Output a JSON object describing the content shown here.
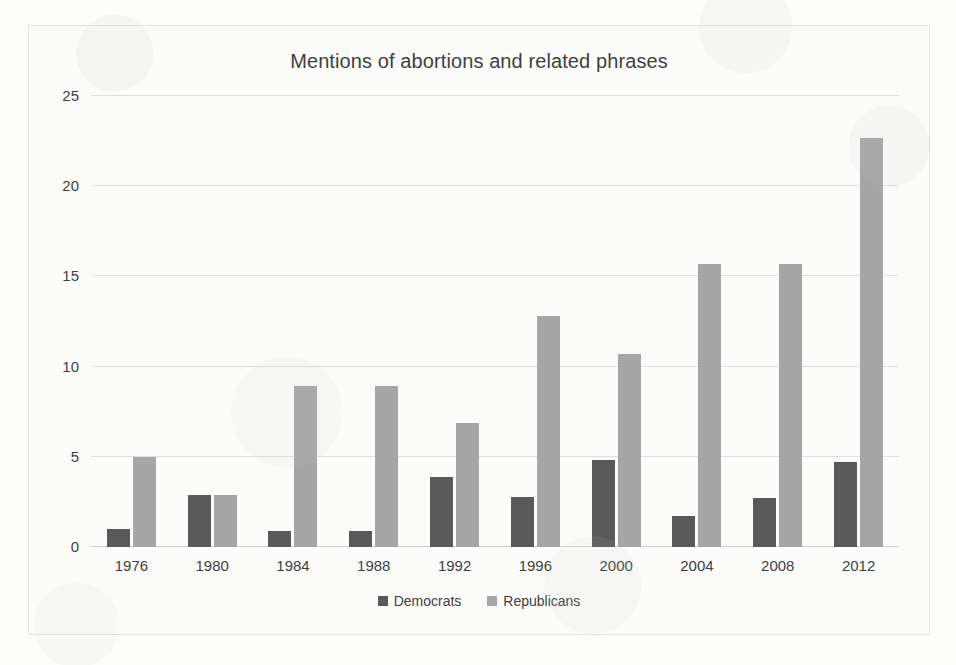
{
  "chart_data": {
    "type": "bar",
    "title": "Mentions of abortions and related phrases",
    "xlabel": "",
    "ylabel": "",
    "categories": [
      "1976",
      "1980",
      "1984",
      "1988",
      "1992",
      "1996",
      "2000",
      "2004",
      "2008",
      "2012"
    ],
    "series": [
      {
        "name": "Democrats",
        "color": "#595959",
        "values": [
          1.0,
          2.9,
          0.9,
          0.9,
          3.9,
          2.8,
          4.8,
          1.7,
          2.7,
          4.7
        ]
      },
      {
        "name": "Republicans",
        "color": "#a6a6a6",
        "values": [
          5.0,
          2.9,
          8.9,
          8.9,
          6.9,
          12.8,
          10.7,
          15.7,
          15.7,
          22.7
        ]
      }
    ],
    "ylim": [
      0,
      25
    ],
    "yticks": [
      0,
      5,
      10,
      15,
      20,
      25
    ],
    "ytick_labels": [
      "0",
      "5",
      "10",
      "15",
      "20",
      "25"
    ],
    "grid": true,
    "legend_position": "bottom"
  },
  "colors": {
    "democrats": "#595959",
    "republicans": "#a6a6a6",
    "gridline": "#dedede",
    "frame_border": "#e2e2e0",
    "text": "#3f3f3f",
    "background": "#fcfcfb"
  }
}
